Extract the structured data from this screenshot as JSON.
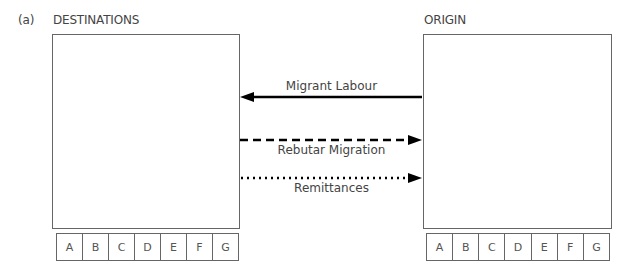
{
  "figure": {
    "panel_label": "(a)"
  },
  "destinations": {
    "title": "DESTINATIONS",
    "letters": [
      "A",
      "B",
      "C",
      "D",
      "E",
      "F",
      "G"
    ]
  },
  "origin": {
    "title": "ORIGIN",
    "letters": [
      "A",
      "B",
      "C",
      "D",
      "E",
      "F",
      "G"
    ]
  },
  "flows": [
    {
      "label": "Migrant Labour",
      "style": "solid",
      "direction": "origin-to-destinations"
    },
    {
      "label": "Rebutar Migration",
      "style": "dashed",
      "direction": "destinations-to-origin"
    },
    {
      "label": "Remittances",
      "style": "dotted",
      "direction": "destinations-to-origin"
    }
  ],
  "colors": {
    "line": "#000000",
    "border": "#666666",
    "text": "#444444"
  }
}
